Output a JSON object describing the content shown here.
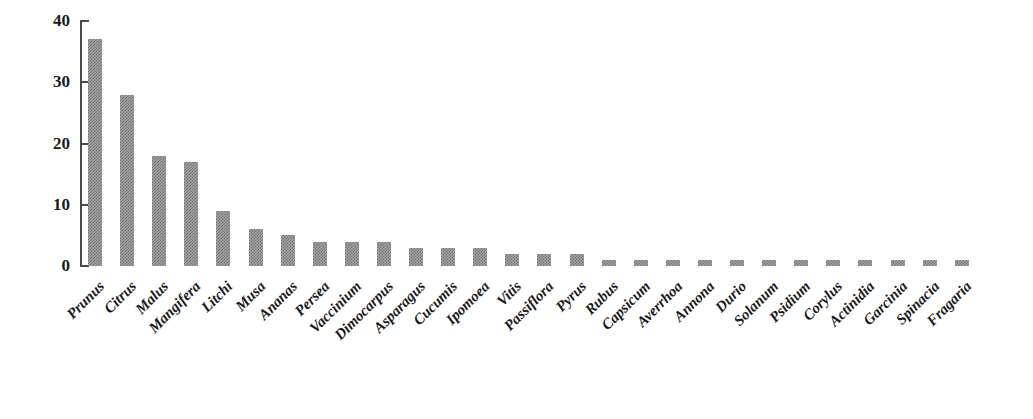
{
  "chart_data": {
    "type": "bar",
    "title": "",
    "subtitle": "",
    "xlabel": "",
    "ylabel": "",
    "ylim": [
      0,
      40
    ],
    "yticks": [
      0,
      10,
      20,
      30,
      40
    ],
    "grid": false,
    "legend": null,
    "orientation": "vertical",
    "bar_color": "#8c8c8c",
    "categories": [
      "Prunus",
      "Citrus",
      "Malus",
      "Mangifera",
      "Litchi",
      "Musa",
      "Ananas",
      "Persea",
      "Vaccinium",
      "Dimocarpus",
      "Asparagus",
      "Cucumis",
      "Ipomoea",
      "Vitis",
      "Passiflora",
      "Pyrus",
      "Rubus",
      "Capsicum",
      "Averrhoa",
      "Annona",
      "Durio",
      "Solanum",
      "Psidium",
      "Corylus",
      "Actinidia",
      "Garcinia",
      "Spinacia",
      "Fragaria"
    ],
    "values": [
      37,
      28,
      18,
      17,
      9,
      6,
      5,
      4,
      4,
      4,
      3,
      3,
      3,
      2,
      2,
      2,
      1,
      1,
      1,
      1,
      1,
      1,
      1,
      1,
      1,
      1,
      1,
      1
    ]
  },
  "axis": {
    "y_tick_labels": [
      "40",
      "30",
      "20",
      "10",
      "0"
    ],
    "axis_color": "#4a4a4a"
  }
}
